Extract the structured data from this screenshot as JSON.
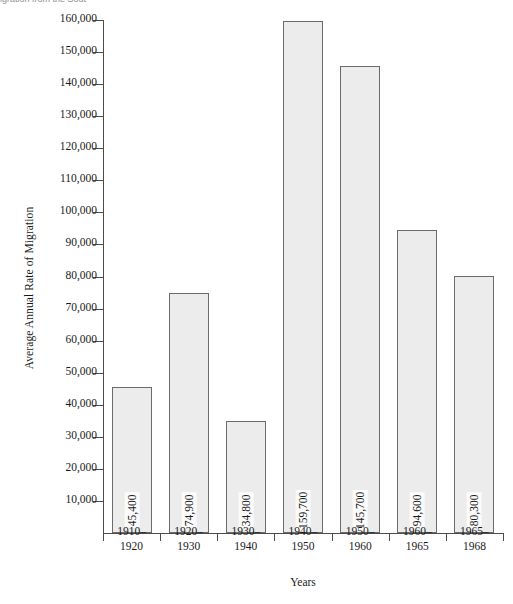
{
  "caption_fragment": "igration from the Sout",
  "chart_data": {
    "type": "bar",
    "title": "",
    "xlabel": "Years",
    "ylabel": "Average Annual Rate of Migration",
    "categories": [
      "1910–\n1920",
      "1920–\n1930",
      "1930–\n1940",
      "1940–\n1950",
      "1950–\n1960",
      "1960–\n1965",
      "1965–\n1968"
    ],
    "category_lines": [
      [
        "1910–",
        "1920"
      ],
      [
        "1920–",
        "1930"
      ],
      [
        "1930–",
        "1940"
      ],
      [
        "1940–",
        "1950"
      ],
      [
        "1950–",
        "1960"
      ],
      [
        "1960–",
        "1965"
      ],
      [
        "1965–",
        "1968"
      ]
    ],
    "values": [
      45400,
      74900,
      34800,
      159700,
      145700,
      94600,
      80300
    ],
    "value_labels": [
      "45,400",
      "74,900",
      "34,800",
      "159,700",
      "145,700",
      "94,600",
      "80,300"
    ],
    "ylim": [
      0,
      160000
    ],
    "ytick_values": [
      10000,
      20000,
      30000,
      40000,
      50000,
      60000,
      70000,
      80000,
      90000,
      100000,
      110000,
      120000,
      130000,
      140000,
      150000,
      160000
    ],
    "ytick_labels": [
      "10,000",
      "20,000",
      "30,000",
      "40,000",
      "50,000",
      "60,000",
      "70,000",
      "80,000",
      "90,000",
      "100,000",
      "110,000",
      "120,000",
      "130,000",
      "140,000",
      "150,000",
      "160,000"
    ],
    "grid": false,
    "legend": null,
    "bar_fill": "#ececec",
    "bar_stroke": "#6b6b6b",
    "axis_color": "#4c4c4c"
  }
}
